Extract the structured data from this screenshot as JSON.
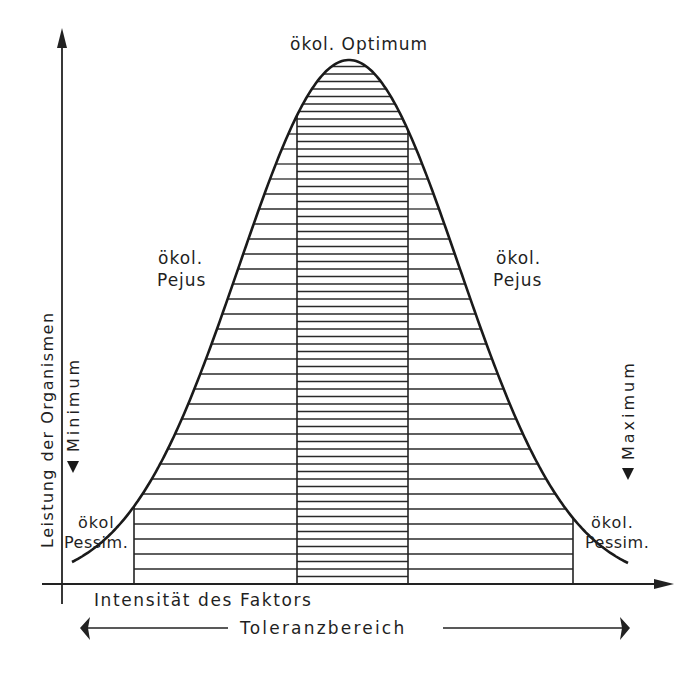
{
  "diagram": {
    "y_axis_label": "Leistung der Organismen",
    "x_axis_label": "Intensität des Faktors",
    "range_label": "Toleranzbereich",
    "labels": {
      "optimum": "ökol. Optimum",
      "pejus_left_line1": "ökol.",
      "pejus_left_line2": "Pejus",
      "pejus_right_line1": "ökol.",
      "pejus_right_line2": "Pejus",
      "pessimum_left_line1": "ökol.",
      "pessimum_left_line2": "Pessim.",
      "pessimum_right_line1": "ökol.",
      "pessimum_right_line2": "Pessim.",
      "minimum": "Minimum",
      "maximum": "Maximum"
    },
    "zones": [
      "Minimum",
      "Pessimum",
      "Pejus",
      "Optimum",
      "Pejus",
      "Pessimum",
      "Maximum"
    ],
    "line_color": "#1f1f1f"
  }
}
